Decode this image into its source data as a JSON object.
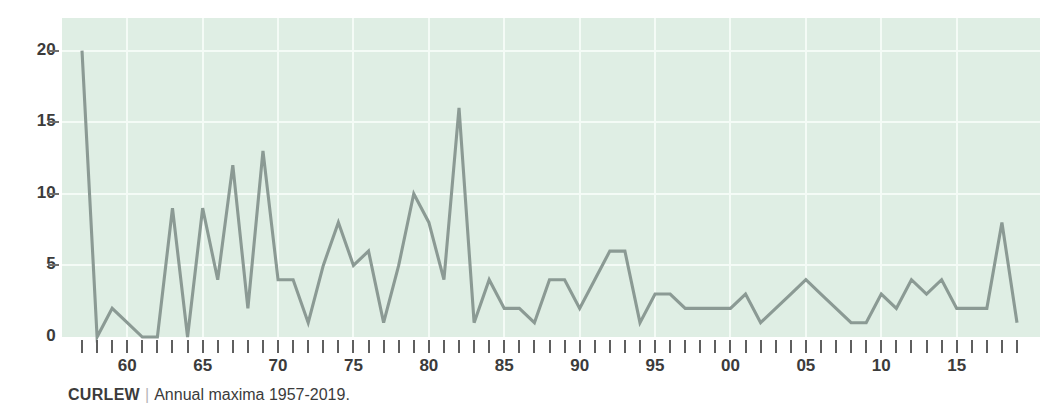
{
  "caption": {
    "series_name": "CURLEW",
    "separator": "|",
    "description": "Annual maxima 1957-2019."
  },
  "colors": {
    "plot_background": "#dfeee4",
    "gridline": "#f4fbf6",
    "line": "#8b9a94",
    "tick": "#5f5f5f",
    "text": "#3b3b3b",
    "page_background": "#ffffff"
  },
  "axes": {
    "y": {
      "labels": [
        "20",
        "15",
        "10",
        "5",
        "0"
      ],
      "values": [
        20,
        15,
        10,
        5,
        0
      ],
      "min": 0,
      "max": 21.3,
      "tick_style": "dash"
    },
    "x": {
      "labels": [
        "60",
        "65",
        "70",
        "75",
        "80",
        "85",
        "90",
        "95",
        "00",
        "05",
        "10",
        "15"
      ],
      "label_years": [
        1960,
        1965,
        1970,
        1975,
        1980,
        1985,
        1990,
        1995,
        2000,
        2005,
        2010,
        2015
      ],
      "min": 1957,
      "max": 2019,
      "tick_every": 1
    }
  },
  "chart_data": {
    "type": "line",
    "title": "CURLEW",
    "subtitle": "Annual maxima 1957-2019.",
    "xlabel": "",
    "ylabel": "",
    "xlim": [
      1957,
      2019
    ],
    "ylim": [
      0,
      21.3
    ],
    "grid": true,
    "legend": null,
    "series": [
      {
        "name": "CURLEW annual maxima",
        "color": "#8b9a94",
        "x": [
          1957,
          1958,
          1959,
          1960,
          1961,
          1962,
          1963,
          1964,
          1965,
          1966,
          1967,
          1968,
          1969,
          1970,
          1971,
          1972,
          1973,
          1974,
          1975,
          1976,
          1977,
          1978,
          1979,
          1980,
          1981,
          1982,
          1983,
          1984,
          1985,
          1986,
          1987,
          1988,
          1989,
          1990,
          1991,
          1992,
          1993,
          1994,
          1995,
          1996,
          1997,
          1998,
          1999,
          2000,
          2001,
          2002,
          2003,
          2004,
          2005,
          2006,
          2007,
          2008,
          2009,
          2010,
          2011,
          2012,
          2013,
          2014,
          2015,
          2016,
          2017,
          2018,
          2019
        ],
        "values": [
          20,
          0,
          2,
          1,
          0,
          0,
          9,
          0,
          9,
          4,
          12,
          2,
          13,
          4,
          4,
          1,
          5,
          8,
          5,
          6,
          1,
          5,
          10,
          8,
          4,
          16,
          1,
          4,
          2,
          2,
          1,
          4,
          4,
          2,
          4,
          6,
          6,
          1,
          3,
          3,
          2,
          2,
          2,
          2,
          3,
          1,
          2,
          3,
          4,
          3,
          2,
          1,
          1,
          3,
          2,
          4,
          3,
          4,
          2,
          2,
          2,
          8,
          1
        ]
      }
    ]
  }
}
